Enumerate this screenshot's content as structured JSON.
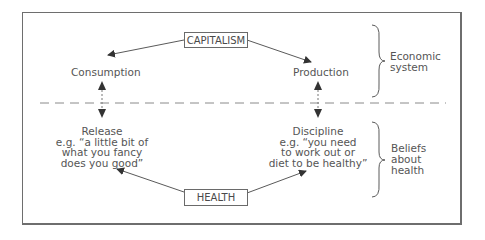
{
  "diagram": {
    "top_node": "CAPITALISM",
    "bottom_node": "HEALTH",
    "left_upper": "Consumption",
    "right_upper": "Production",
    "left_lower": {
      "title": "Release",
      "lines": [
        "e.g. “a little bit of",
        "what you fancy",
        "does you good”"
      ]
    },
    "right_lower": {
      "title": "Discipline",
      "lines": [
        "e.g. “you need",
        "to work out or",
        "diet to be healthy”"
      ]
    },
    "brace_upper": {
      "lines": [
        "Economic",
        "system"
      ]
    },
    "brace_lower": {
      "lines": [
        "Beliefs",
        "about",
        "health"
      ]
    },
    "colors": {
      "line": "#5a5a5a",
      "text": "#555555",
      "border": "#6e6e6e"
    }
  }
}
